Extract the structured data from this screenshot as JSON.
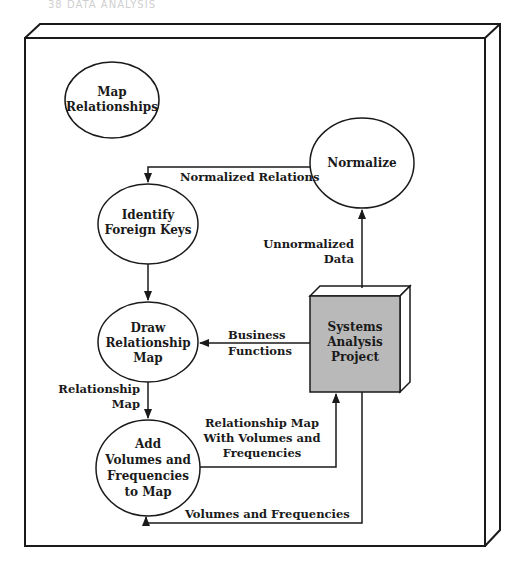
{
  "page_header": "38   DATA ANALYSIS",
  "title_node": {
    "lines": [
      "Map",
      "Relationships"
    ]
  },
  "processes": [
    {
      "id": "normalize",
      "lines": [
        "Normalize"
      ]
    },
    {
      "id": "identify-foreign-keys",
      "lines": [
        "Identify",
        "Foreign Keys"
      ]
    },
    {
      "id": "draw-relationship-map",
      "lines": [
        "Draw",
        "Relationship",
        "Map"
      ]
    },
    {
      "id": "add-volumes-frequencies",
      "lines": [
        "Add",
        "Volumes and",
        "Frequencies",
        "to Map"
      ]
    }
  ],
  "data_store": {
    "lines": [
      "Systems",
      "Analysis",
      "Project"
    ],
    "fill": "#b9b9b9"
  },
  "flows": {
    "normalized_relations": [
      "Normalized Relations"
    ],
    "unnormalized_data": [
      "Unnormalized",
      "Data"
    ],
    "business_functions": [
      "Business",
      "Functions"
    ],
    "relationship_map": [
      "Relationship",
      "Map"
    ],
    "relationship_map_volumes": [
      "Relationship Map",
      "With Volumes and",
      "Frequencies"
    ],
    "volumes_frequencies": [
      "Volumes and Frequencies"
    ]
  }
}
